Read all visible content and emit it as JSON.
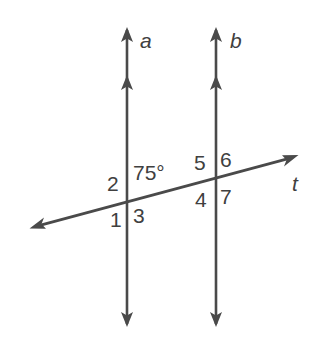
{
  "figure": {
    "background_color": "#ffffff",
    "stroke_color": "#4a4a4a",
    "text_color": "#404040"
  },
  "lines": {
    "parallel_left": {
      "name": "a",
      "label": "a",
      "orientation": "vertical",
      "x": 127,
      "y_top": 28,
      "y_bottom": 326,
      "arrowheads": "both-ends"
    },
    "parallel_right": {
      "name": "b",
      "label": "b",
      "orientation": "vertical",
      "x": 216,
      "y_top": 28,
      "y_bottom": 326,
      "arrowheads": "both-ends"
    },
    "transversal": {
      "name": "t",
      "label": "t",
      "orientation": "oblique",
      "x_left": 30,
      "y_left": 228,
      "x_right": 298,
      "y_right": 156,
      "arrowheads": "both-ends"
    }
  },
  "intersections": [
    {
      "id": "intersection-a-t",
      "line": "a",
      "x": 127,
      "y": 198
    },
    {
      "id": "intersection-b-t",
      "line": "b",
      "x": 216,
      "y": 174
    }
  ],
  "labels": {
    "line_a": {
      "text": "a",
      "x": 140,
      "y": 30
    },
    "line_b": {
      "text": "b",
      "x": 230,
      "y": 30
    },
    "line_t": {
      "text": "t",
      "x": 292,
      "y": 173
    },
    "angle_measure": {
      "text": "75°",
      "x": 133,
      "y": 162
    },
    "angle_2": {
      "text": "2",
      "x": 107,
      "y": 173
    },
    "angle_1": {
      "text": "1",
      "x": 110,
      "y": 209
    },
    "angle_3": {
      "text": "3",
      "x": 133,
      "y": 205
    },
    "angle_5": {
      "text": "5",
      "x": 194,
      "y": 152
    },
    "angle_6": {
      "text": "6",
      "x": 220,
      "y": 149
    },
    "angle_4": {
      "text": "4",
      "x": 195,
      "y": 189
    },
    "angle_7": {
      "text": "7",
      "x": 220,
      "y": 186
    }
  },
  "angles": [
    {
      "number": "1",
      "position": "below-left of intersection a"
    },
    {
      "number": "2",
      "position": "above-left of intersection a"
    },
    {
      "number": "3",
      "position": "below-right of intersection a"
    },
    {
      "number": "4",
      "position": "below-left of intersection b"
    },
    {
      "number": "5",
      "position": "above-left of intersection b"
    },
    {
      "number": "6",
      "position": "above-right of intersection b"
    },
    {
      "number": "7",
      "position": "below-right of intersection b"
    },
    {
      "number": "75°",
      "position": "above-right of intersection a",
      "measure": 75
    }
  ]
}
